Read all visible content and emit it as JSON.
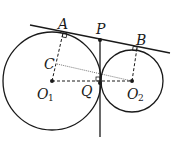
{
  "diagram": {
    "colors": {
      "stroke": "#1a1a1a",
      "background": "#ffffff"
    },
    "circles": [
      {
        "name": "O1",
        "cx": 52,
        "cy": 81,
        "r": 49
      },
      {
        "name": "O2",
        "cx": 132,
        "cy": 81,
        "r": 31
      }
    ],
    "labels": {
      "A": "A",
      "B": "B",
      "P": "P",
      "C": "C",
      "Q": "Q",
      "O1_main": "O",
      "O1_sub": "1",
      "O2_main": "O",
      "O2_sub": "2"
    },
    "points": {
      "A": [
        63,
        33
      ],
      "B": [
        137,
        48
      ],
      "P": [
        100,
        40
      ],
      "C": [
        57,
        64
      ],
      "Q": [
        100,
        81
      ],
      "O1": [
        52,
        81
      ],
      "O2": [
        132,
        81
      ]
    }
  }
}
